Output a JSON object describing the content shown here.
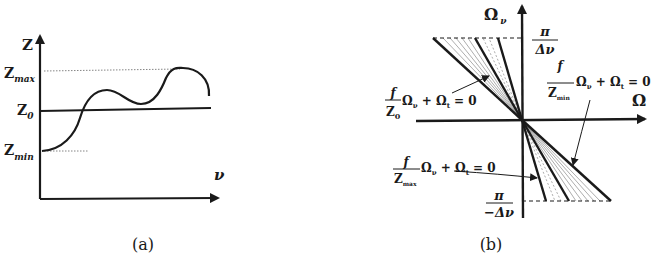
{
  "figure_a": {
    "caption": "(a)",
    "y_axis_label": "Z",
    "x_axis_label": "ν",
    "levels": {
      "z_max": {
        "base": "Z",
        "sub": "max"
      },
      "z_0": {
        "base": "Z",
        "sub": "0"
      },
      "z_min": {
        "base": "Z",
        "sub": "min"
      }
    }
  },
  "figure_b": {
    "caption": "(b)",
    "y_axis_label": {
      "base": "Ω",
      "sub": "ν"
    },
    "x_axis_label": "Ω",
    "top_limit": {
      "num": "π",
      "den": "Δν"
    },
    "bottom_limit": {
      "num": "π",
      "den": "−Δν"
    },
    "eq_z0": {
      "num": "f",
      "den_base": "Z",
      "den_sub": "0",
      "rest": "Ω",
      "rest_sub": "ν",
      "plus": " + Ω",
      "plus_sub": "t",
      "tail": " = 0"
    },
    "eq_zmin": {
      "num": "f",
      "den_base": "Z",
      "den_sub": "min",
      "rest": "Ω",
      "rest_sub": "ν",
      "plus": " + Ω",
      "plus_sub": "t",
      "tail": " = 0"
    },
    "eq_zmax": {
      "num": "f",
      "den_base": "Z",
      "den_sub": "max",
      "rest": "Ω",
      "rest_sub": "ν",
      "plus": " + Ω",
      "plus_sub": "t",
      "tail": " = 0"
    }
  },
  "colors": {
    "ink": "#1a1a1a",
    "thin": "#8a8a8a",
    "background": "#ffffff"
  }
}
